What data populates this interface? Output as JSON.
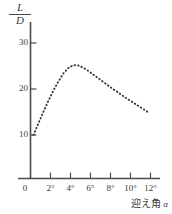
{
  "chart_data": {
    "type": "line",
    "title": "",
    "subtitle": "",
    "style": "dotted",
    "ylabel_numerator": "L",
    "ylabel_denominator": "D",
    "ylabel": "L/D",
    "xlabel": "迎え角 α",
    "xlabel_text": "迎え角",
    "xlabel_symbol": "α",
    "origin_label": "0",
    "xticks": [
      0,
      2,
      4,
      6,
      8,
      10,
      12
    ],
    "xtick_labels": [
      "0",
      "2°",
      "4°",
      "6°",
      "8°",
      "10°",
      "12°"
    ],
    "yticks": [
      10,
      20,
      30
    ],
    "ytick_labels": [
      "10",
      "20",
      "30"
    ],
    "xlim": [
      0,
      13
    ],
    "ylim": [
      0,
      33
    ],
    "grid": false,
    "legend": "none",
    "x": [
      0.3,
      0.8,
      1.3,
      1.8,
      2.3,
      2.8,
      3.3,
      3.8,
      4.3,
      4.8,
      5.3,
      5.8,
      6.3,
      6.8,
      7.3,
      7.8,
      8.3,
      8.8,
      9.3,
      9.8,
      10.3,
      10.8,
      11.3,
      11.8
    ],
    "values": [
      10.0,
      12.6,
      15.1,
      17.5,
      19.7,
      21.7,
      23.4,
      24.6,
      25.2,
      25.1,
      24.6,
      23.9,
      23.1,
      22.3,
      21.5,
      20.7,
      19.9,
      19.2,
      18.4,
      17.7,
      17.0,
      16.3,
      15.6,
      14.9
    ],
    "peak": {
      "x": 4.3,
      "y": 25.2
    },
    "start": {
      "x": 0.3,
      "y": 10.0
    },
    "end": {
      "x": 11.8,
      "y": 14.9
    },
    "axis_color": "#4a4a4a",
    "curve_color": "#3c3c48"
  }
}
